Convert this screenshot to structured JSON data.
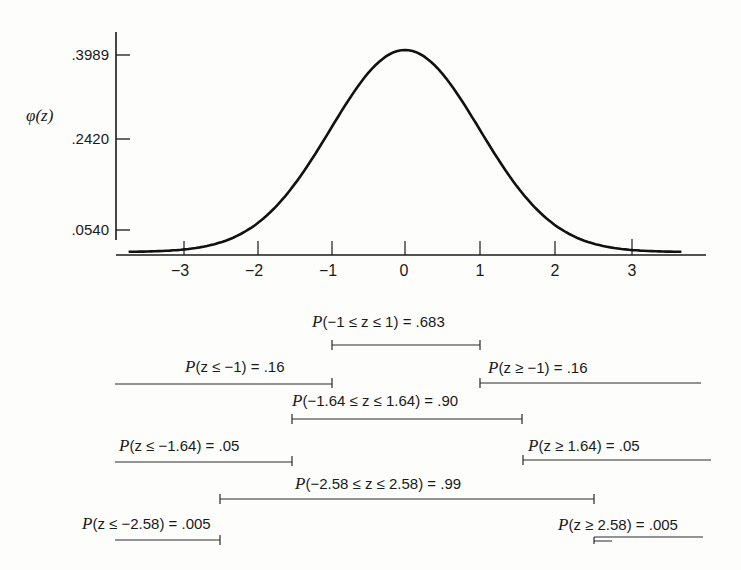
{
  "chart_data": {
    "type": "line",
    "title": "",
    "xlabel": "z",
    "ylabel": "φ(z)",
    "x_ticks": [
      "−3",
      "−2",
      "−1",
      "0",
      "1",
      "2",
      "3"
    ],
    "y_ticks": [
      ".3989",
      ".2420",
      ".0540"
    ],
    "xlim": [
      -3.7,
      3.7
    ],
    "ylim": [
      0,
      0.42
    ],
    "grid": false,
    "legend": null,
    "series": [
      {
        "name": "standard normal density φ(z)",
        "x": [
          -3.7,
          -3,
          -2.5,
          -2,
          -1.5,
          -1,
          -0.5,
          0,
          0.5,
          1,
          1.5,
          2,
          2.5,
          3,
          3.7
        ],
        "values": [
          0.0004,
          0.0044,
          0.0175,
          0.054,
          0.1295,
          0.242,
          0.3521,
          0.3989,
          0.3521,
          0.242,
          0.1295,
          0.054,
          0.0175,
          0.0044,
          0.0004
        ]
      }
    ],
    "annotations": [
      {
        "text": "P(−1 ≤ z ≤ 1) = .683",
        "from": -1,
        "to": 1
      },
      {
        "text": "P(z ≤ −1) = .16",
        "from": "-inf",
        "to": -1
      },
      {
        "text": "P(z ≥ −1) = .16",
        "from": 1,
        "to": "inf"
      },
      {
        "text": "P(−1.64 ≤ z ≤ 1.64) = .90",
        "from": -1.64,
        "to": 1.64
      },
      {
        "text": "P(z ≤ −1.64) = .05",
        "from": "-inf",
        "to": -1.64
      },
      {
        "text": "P(z ≥ 1.64) = .05",
        "from": 1.64,
        "to": "inf"
      },
      {
        "text": "P(−2.58 ≤ z ≤ 2.58) = .99",
        "from": -2.58,
        "to": 2.58
      },
      {
        "text": "P(z ≤ −2.58) = .005",
        "from": "-inf",
        "to": -2.58
      },
      {
        "text": "P(z ≥ 2.58) = .005",
        "from": 2.58,
        "to": "inf"
      }
    ]
  },
  "axis": {
    "ylabel": "φ(z)",
    "y_ticks": [
      ".3989",
      ".2420",
      ".0540"
    ],
    "x_ticks": [
      "−3",
      "−2",
      "−1",
      "0",
      "1",
      "2",
      "3"
    ]
  },
  "labels": {
    "p683": {
      "p": "P",
      "rest": "(−1 ≤ z ≤ 1) = .683"
    },
    "pLeft1": {
      "p": "P",
      "rest": "(z ≤ −1) = .16"
    },
    "pRight1": {
      "p": "P",
      "rest": "(z ≥ −1) = .16"
    },
    "p90": {
      "p": "P",
      "rest": "(−1.64 ≤ z ≤ 1.64) = .90"
    },
    "pLeft164": {
      "p": "P",
      "rest": "(z ≤ −1.64) = .05"
    },
    "pRight164": {
      "p": "P",
      "rest": "(z ≥ 1.64) = .05"
    },
    "p99": {
      "p": "P",
      "rest": "(−2.58 ≤ z ≤ 2.58) = .99"
    },
    "pLeft258": {
      "p": "P",
      "rest": "(z ≤ −2.58) = .005"
    },
    "pRight258": {
      "p": "P",
      "rest": "(z ≥ 2.58) = .005"
    }
  }
}
